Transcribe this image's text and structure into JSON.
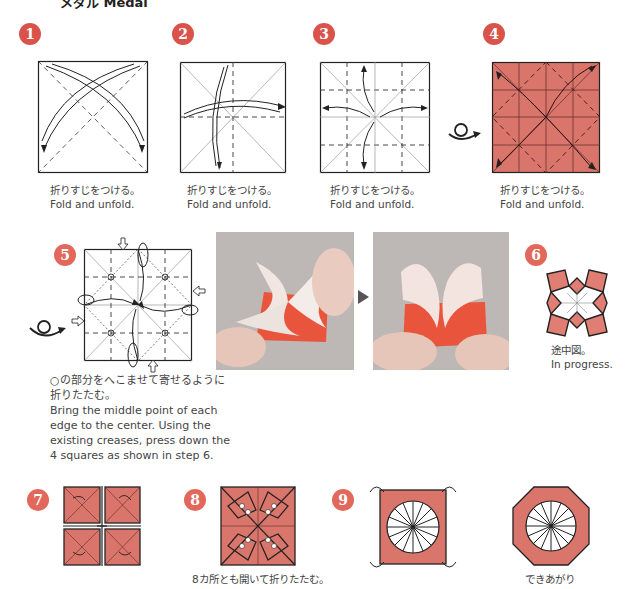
{
  "header": {
    "title": "メダル Medal"
  },
  "colors": {
    "badge": "#d9534a",
    "paper": "#d9756b",
    "paper_light": "#e8938a",
    "line": "#222222"
  },
  "steps": [
    {
      "number": "1",
      "caption_jp": "折りすじをつける。",
      "caption_en": "Fold and unfold."
    },
    {
      "number": "2",
      "caption_jp": "折りすじをつける。",
      "caption_en": "Fold and unfold."
    },
    {
      "number": "3",
      "caption_jp": "折りすじをつける。",
      "caption_en": "Fold and unfold."
    },
    {
      "number": "4",
      "caption_jp": "折りすじをつける。",
      "caption_en": "Fold and unfold."
    },
    {
      "number": "5",
      "caption_jp_1": "○の部分をへこませて寄せるように",
      "caption_jp_2": "折りたたむ。",
      "caption_en_1": "Bring the middle point of each",
      "caption_en_2": "edge to the center. Using the",
      "caption_en_3": "existing creases, press down the",
      "caption_en_4": "4 squares as shown in step 6."
    },
    {
      "number": "6",
      "caption_jp": "途中図。",
      "caption_en": "In progress."
    },
    {
      "number": "7"
    },
    {
      "number": "8",
      "caption_jp": "8カ所とも開いて折りたたむ。"
    },
    {
      "number": "9"
    },
    {
      "number": "",
      "caption_jp": "できあがり"
    }
  ],
  "icons": {
    "turn_over": "turn-over-icon",
    "next": "play-arrow-icon"
  }
}
